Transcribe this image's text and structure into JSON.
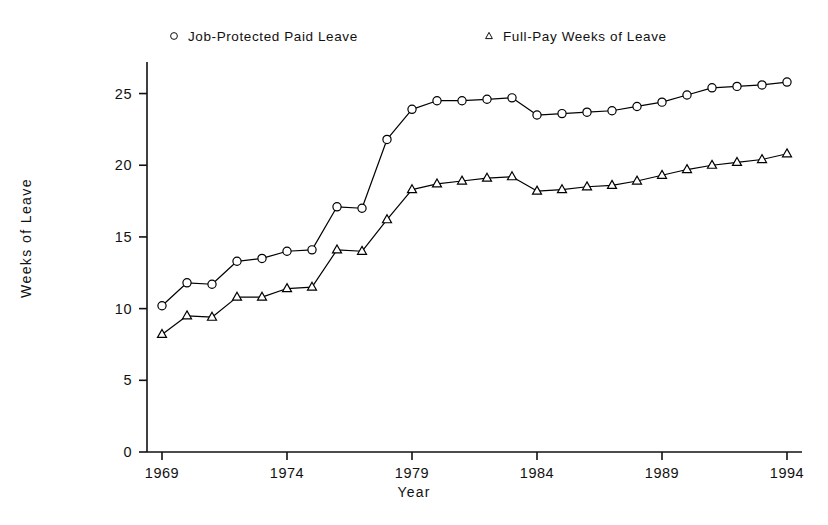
{
  "chart_data": {
    "type": "line",
    "title": "",
    "subtitle": "",
    "xlabel": "Year",
    "ylabel": "Weeks of Leave",
    "xlim": [
      1968.4,
      1994.6
    ],
    "ylim": [
      0,
      27.2
    ],
    "xticks": [
      1969,
      1974,
      1979,
      1984,
      1989,
      1994
    ],
    "xticklabels": [
      "1969",
      "1974",
      "1979",
      "1984",
      "1989",
      "1994"
    ],
    "yticks": [
      0,
      5,
      10,
      15,
      20,
      25
    ],
    "yticklabels": [
      "0",
      "5",
      "10",
      "15",
      "20",
      "25"
    ],
    "grid": false,
    "legend_position": "above-plot",
    "x": [
      1969,
      1970,
      1971,
      1972,
      1973,
      1974,
      1975,
      1976,
      1977,
      1978,
      1979,
      1980,
      1981,
      1982,
      1983,
      1984,
      1985,
      1986,
      1987,
      1988,
      1989,
      1990,
      1991,
      1992,
      1993,
      1994
    ],
    "series": [
      {
        "name": "Job-Protected Paid Leave",
        "marker": "circle",
        "color": "#000000",
        "values": [
          10.2,
          11.8,
          11.7,
          13.3,
          13.5,
          14.0,
          14.1,
          17.1,
          17.0,
          21.8,
          23.9,
          24.5,
          24.5,
          24.6,
          24.7,
          23.5,
          23.6,
          23.7,
          23.8,
          24.1,
          24.4,
          24.9,
          25.4,
          25.5,
          25.6,
          25.8
        ]
      },
      {
        "name": "Full-Pay Weeks of Leave",
        "marker": "triangle",
        "color": "#000000",
        "values": [
          8.2,
          9.5,
          9.4,
          10.8,
          10.8,
          11.4,
          11.5,
          14.1,
          14.0,
          16.2,
          18.3,
          18.7,
          18.9,
          19.1,
          19.2,
          18.2,
          18.3,
          18.5,
          18.6,
          18.9,
          19.3,
          19.7,
          20.0,
          20.2,
          20.4,
          20.8
        ]
      }
    ]
  },
  "legend": {
    "entries": [
      {
        "label": "Job-Protected Paid Leave",
        "marker": "circle-marker-icon"
      },
      {
        "label": "Full-Pay Weeks of Leave",
        "marker": "triangle-marker-icon"
      }
    ]
  },
  "axes": {
    "x_title": "Year",
    "y_title": "Weeks of Leave"
  }
}
